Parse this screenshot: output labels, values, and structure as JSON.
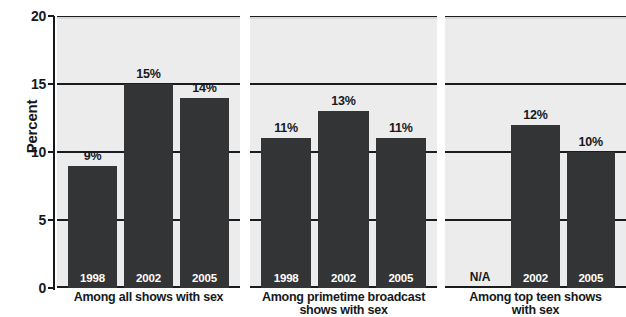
{
  "chart_data": {
    "type": "bar",
    "title": "",
    "xlabel": "",
    "ylabel": "Percent",
    "ylim": [
      0,
      20
    ],
    "yticks": [
      0,
      5,
      10,
      15,
      20
    ],
    "ytick_labels": [
      "0",
      "5",
      "10",
      "15",
      "20"
    ],
    "grid": true,
    "legend": "none",
    "value_suffix": "%",
    "panels": [
      {
        "caption_lines": [
          "Among all shows with sex"
        ],
        "categories": [
          "1998",
          "2002",
          "2005"
        ],
        "values": [
          9,
          15,
          14
        ],
        "value_labels": [
          "9%",
          "15%",
          "14%"
        ]
      },
      {
        "caption_lines": [
          "Among primetime broadcast",
          "shows with sex"
        ],
        "categories": [
          "1998",
          "2002",
          "2005"
        ],
        "values": [
          11,
          13,
          11
        ],
        "value_labels": [
          "11%",
          "13%",
          "11%"
        ]
      },
      {
        "caption_lines": [
          "Among top teen shows",
          "with sex"
        ],
        "categories": [
          "N/A",
          "2002",
          "2005"
        ],
        "values": [
          null,
          12,
          10
        ],
        "value_labels": [
          "",
          "12%",
          "10%"
        ]
      }
    ],
    "colors": {
      "bar": "#333436",
      "plot_background": "#ececed",
      "plot_background_top_band": "#d8d8d8",
      "gridline": "#1a1d20",
      "text": "#15191c",
      "bar_label_text": "#ffffff"
    }
  }
}
